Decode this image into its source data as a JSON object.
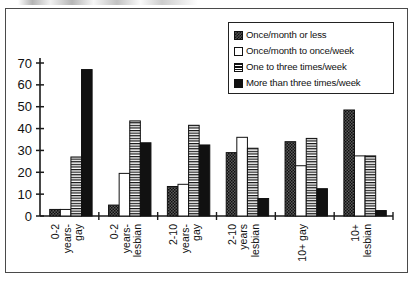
{
  "figure": {
    "border_color": "#4a4a4a",
    "background": "#ffffff"
  },
  "legend": {
    "position": "top-right",
    "items": [
      {
        "label": "Once/month or less",
        "swatch": "checkered-dark-swatch",
        "color": "#4d4d4d"
      },
      {
        "label": "Once/month to once/week",
        "swatch": "white-swatch",
        "color": "#ffffff"
      },
      {
        "label": "One to three times/week",
        "swatch": "horizontal-stripe-swatch",
        "color": "#ffffff"
      },
      {
        "label": "More than three times/week",
        "swatch": "solid-black-swatch",
        "color": "#111111"
      }
    ]
  },
  "axes": {
    "y_ticks": [
      "0",
      "10",
      "20",
      "30",
      "40",
      "50",
      "60",
      "70"
    ],
    "x_labels": [
      "0-2 years- gay",
      "0-2 years- lesbian",
      "2-10 years- gay",
      "2-10 years lesbian",
      "10+ gay",
      "10+ lesbian"
    ]
  },
  "chart_data": {
    "type": "bar",
    "title": "",
    "subtitle": "",
    "xlabel": "",
    "ylabel": "",
    "ylim": [
      0,
      70
    ],
    "ytick_step": 10,
    "grid": false,
    "legend_position": "top-right",
    "categories": [
      "0-2 years-gay",
      "0-2 years-lesbian",
      "2-10 years-gay",
      "2-10 years lesbian",
      "10+ gay",
      "10+ lesbian"
    ],
    "category_lines": [
      [
        "0-2",
        "years-",
        "gay"
      ],
      [
        "0-2",
        "years-",
        "lesbian"
      ],
      [
        "2-10",
        "years-",
        "gay"
      ],
      [
        "2-10",
        "years",
        "lesbian"
      ],
      [
        "10+ gay"
      ],
      [
        "10+",
        "lesbian"
      ]
    ],
    "series": [
      {
        "name": "Once/month or less",
        "pattern": "checkered",
        "values": [
          3,
          5,
          13.5,
          29,
          34,
          48.5
        ]
      },
      {
        "name": "Once/month to once/week",
        "pattern": "white",
        "values": [
          3,
          19.5,
          14.5,
          36,
          23,
          27.5
        ]
      },
      {
        "name": "One to three times/week",
        "pattern": "striped",
        "values": [
          27,
          43.5,
          41.5,
          31,
          35.5,
          27.5
        ]
      },
      {
        "name": "More than three times/week",
        "pattern": "solid",
        "values": [
          67,
          33.5,
          32.5,
          8,
          12.5,
          2.5
        ]
      }
    ]
  }
}
